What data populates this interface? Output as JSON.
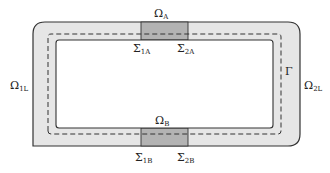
{
  "diagram": {
    "title": "",
    "colors": {
      "band_fill": "#e6e6e6",
      "patch_fill": "#b3b3b3",
      "stroke": "#333333",
      "background": "#ffffff"
    },
    "regions": {
      "omega_a": {
        "symbol": "Ω",
        "sub": "A"
      },
      "omega_b": {
        "symbol": "Ω",
        "sub": "B"
      },
      "omega_1l": {
        "symbol": "Ω",
        "sub": "1L"
      },
      "omega_2l": {
        "symbol": "Ω",
        "sub": "2L"
      }
    },
    "interfaces": {
      "sigma_1a": {
        "symbol": "Σ",
        "sub": "1A"
      },
      "sigma_2a": {
        "symbol": "Σ",
        "sub": "2A"
      },
      "sigma_1b": {
        "symbol": "Σ",
        "sub": "1B"
      },
      "sigma_2b": {
        "symbol": "Σ",
        "sub": "2B"
      }
    },
    "curve": {
      "symbol": "Γ"
    }
  }
}
